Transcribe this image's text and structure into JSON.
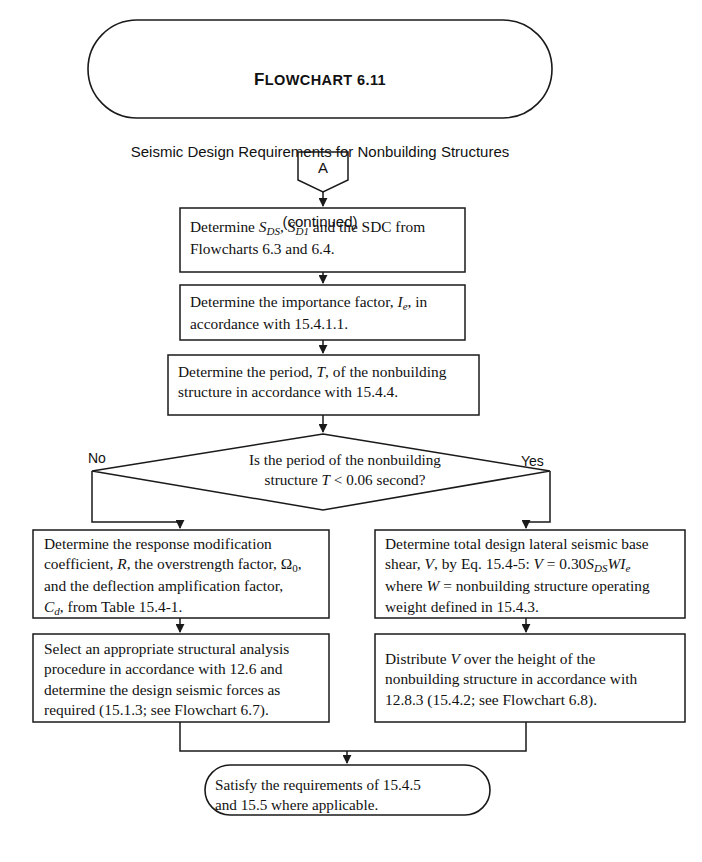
{
  "header": {
    "title_prefix": "F",
    "title_rest": "LOWCHART",
    "title_number": "6.11",
    "subtitle": "Seismic Design Requirements for Nonbuilding Structures",
    "continued": "(continued)"
  },
  "connector": {
    "label": "A"
  },
  "nodes": {
    "box1_line1_a": "Determine ",
    "box1_line1_b": " and the SDC from",
    "box1_line2": "Flowcharts 6.3 and 6.4.",
    "box1_sym1": "S",
    "box1_sym1_sub": "DS",
    "box1_sym2": "S",
    "box1_sym2_sub": "D1",
    "box2_line1_a": "Determine the importance factor, ",
    "box2_sym": "I",
    "box2_sym_sub": "e",
    "box2_line1_b": ", in",
    "box2_line2": "accordance with 15.4.1.1.",
    "box3_line1_a": "Determine the period, ",
    "box3_sym": "T",
    "box3_line1_b": ", of the nonbuilding",
    "box3_line2": "structure in accordance with 15.4.4.",
    "diamond_line1": "Is the period of the nonbuilding",
    "diamond_line2_a": "structure ",
    "diamond_sym": "T",
    "diamond_line2_b": " < 0.06 second?",
    "left1_line1": "Determine the response modification",
    "left1_line2_a": "coefficient, ",
    "left1_sym_r": "R",
    "left1_line2_b": ", the overstrength factor, ",
    "left1_sym_omega": "Ω",
    "left1_sym_omega_sub": "0",
    "left1_line2_c": ",",
    "left1_line3": "and the deflection amplification factor,",
    "left1_sym_cd": "C",
    "left1_sym_cd_sub": "d",
    "left1_line4": ", from Table 15.4-1.",
    "left2_line1": "Select an appropriate structural analysis",
    "left2_line2": "procedure in accordance with 12.6 and",
    "left2_line3": "determine the design seismic forces as",
    "left2_line4": "required (15.1.3; see Flowchart 6.7).",
    "right1_line1": "Determine total design lateral seismic base",
    "right1_line2_a": "shear, ",
    "right1_sym_v1": "V",
    "right1_line2_b": ", by Eq. 15.4-5: ",
    "right1_sym_v2": "V",
    "right1_line2_c": " = 0.30",
    "right1_sym_s": "S",
    "right1_sym_s_sub": "DS",
    "right1_sym_w": "WI",
    "right1_sym_w_sub": "e",
    "right1_line3_a": "where ",
    "right1_sym_w2": "W",
    "right1_line3_b": " = nonbuilding structure operating",
    "right1_line4": "weight defined in 15.4.3.",
    "right2_line1_a": "Distribute ",
    "right2_sym_v": "V",
    "right2_line1_b": " over the height of the",
    "right2_line2": "nonbuilding structure in accordance with",
    "right2_line3": "12.8.3 (15.4.2; see Flowchart 6.8).",
    "end_line1": "Satisfy the requirements of 15.4.5",
    "end_line2": "and 15.5 where applicable."
  },
  "branches": {
    "no_label": "No",
    "yes_label": "Yes"
  },
  "colors": {
    "stroke": "#1a1a1a",
    "text": "#111111",
    "background": "#ffffff"
  }
}
